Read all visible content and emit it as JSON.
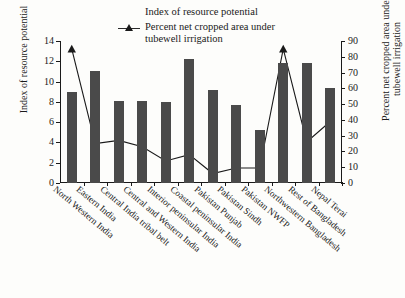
{
  "chart_data": {
    "type": "bar",
    "title": "",
    "xlabel": "",
    "categories": [
      "North Western India",
      "Eastern India",
      "Central India tribal belt",
      "Central and Western India",
      "Interior peninsular India",
      "Coastal peninsular India",
      "Pakistan Punjab",
      "Pakistan Sindh",
      "Pakistan NWFP",
      "Northwestern Bangladesh",
      "Rest of Bangladesh",
      "Nepal Terai"
    ],
    "series": [
      {
        "name": "Index of resource potential",
        "type": "bar",
        "axis": "left",
        "color": "#4a4a4a",
        "values": [
          9.0,
          11.0,
          8.05,
          8.05,
          7.95,
          12.2,
          9.15,
          7.7,
          5.2,
          11.8,
          11.8,
          9.35
        ]
      },
      {
        "name": "Percent net cropped area under tubewell irrigation",
        "type": "line",
        "axis": "right",
        "color": "#1a1a1a",
        "marker": "triangle",
        "values": [
          85,
          25,
          27,
          23,
          14,
          18,
          6,
          9.5,
          9.5,
          85,
          26,
          39
        ]
      }
    ],
    "ylabel": "Index of resource potential",
    "ylim": [
      0,
      14
    ],
    "yticks": [
      0,
      2,
      4,
      6,
      8,
      10,
      12,
      14
    ],
    "y2label": "Percent net cropped area under tubewell irrigation",
    "y2lim": [
      0,
      90
    ],
    "y2ticks": [
      0,
      10,
      20,
      30,
      40,
      50,
      60,
      70,
      80,
      90
    ],
    "grid": false,
    "legend_position": "top-center"
  },
  "legend": {
    "items": [
      {
        "label": "Index of resource potential",
        "marker": "bar-swatch"
      },
      {
        "label": "Percent net cropped area under",
        "label2": "tubewell irrigation",
        "marker": "line-triangle"
      }
    ]
  },
  "axes": {
    "left_title": "Index of resource potential",
    "right_title_line1": "Percent net cropped area under",
    "right_title_line2": "tubewell irrigation"
  }
}
